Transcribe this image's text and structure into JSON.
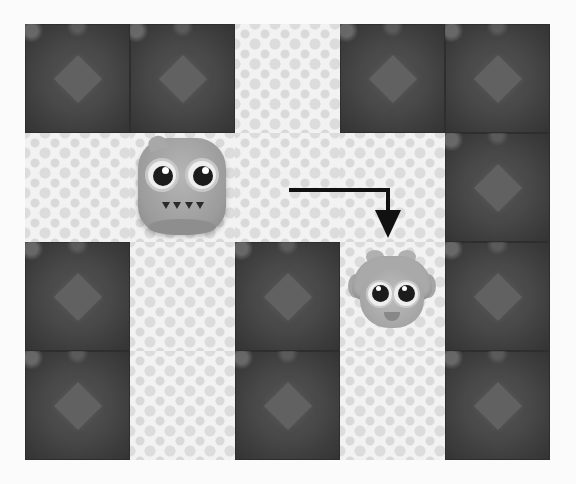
{
  "game": {
    "type": "grid-puzzle",
    "columns": 5,
    "rows": 4,
    "grid": [
      [
        "wall",
        "wall",
        "floor",
        "wall",
        "wall"
      ],
      [
        "floor",
        "floor",
        "floor",
        "floor",
        "wall"
      ],
      [
        "wall",
        "floor",
        "wall",
        "floor",
        "wall"
      ],
      [
        "wall",
        "floor",
        "wall",
        "floor",
        "wall"
      ]
    ],
    "characters": [
      {
        "name": "monster",
        "row": 1,
        "col": 1
      },
      {
        "name": "girl",
        "row": 2,
        "col": 3
      }
    ],
    "move_hint": {
      "path": "right-then-down",
      "from": {
        "row": 1,
        "col": 2
      },
      "to": {
        "row": 2,
        "col": 3
      }
    },
    "colors": {
      "wall": "#474747",
      "floor": "#f2f2f2",
      "arrow": "#111111"
    }
  }
}
